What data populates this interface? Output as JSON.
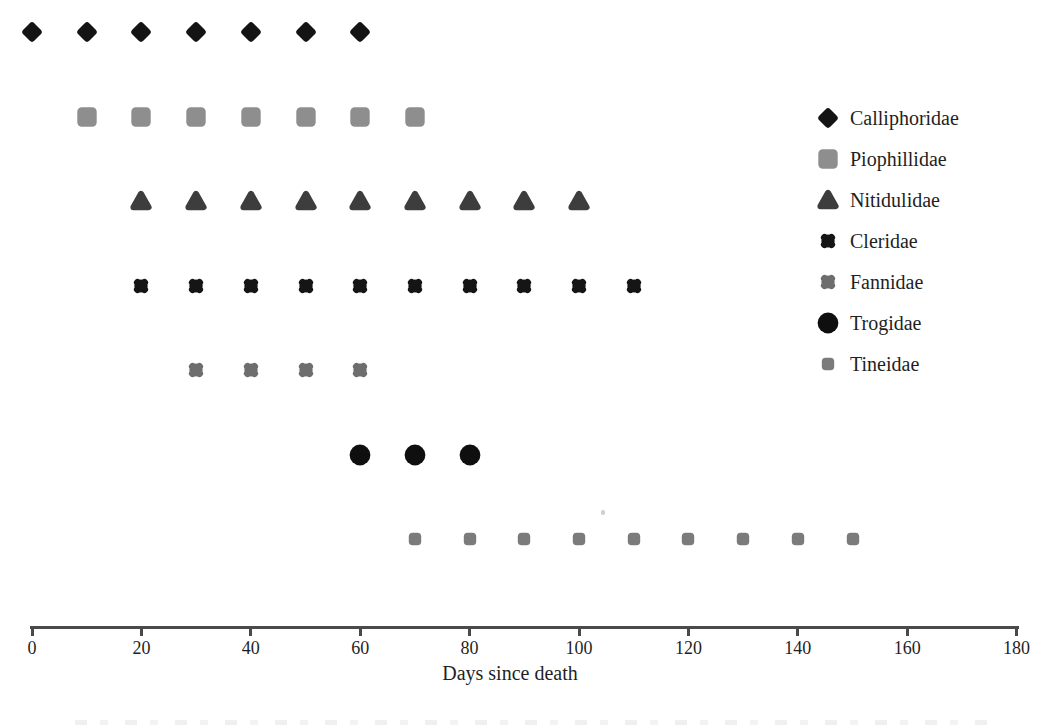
{
  "figure": {
    "background": "#ffffff",
    "text_color": "#1f1f1f",
    "axis_color": "#4a4a4a"
  },
  "chart_data": {
    "type": "scatter",
    "title": "",
    "subtitle": "",
    "xlabel": "Days since death",
    "ylabel": "",
    "grid": false,
    "legend_position": "right",
    "x_axis": {
      "min": 0,
      "max": 180,
      "tick_step": 20,
      "ticks": [
        {
          "value": 0,
          "label": "0"
        },
        {
          "value": 20,
          "label": "20"
        },
        {
          "value": 40,
          "label": "40"
        },
        {
          "value": 60,
          "label": "60"
        },
        {
          "value": 80,
          "label": "80"
        },
        {
          "value": 100,
          "label": "100"
        },
        {
          "value": 120,
          "label": "120"
        },
        {
          "value": 140,
          "label": "140"
        },
        {
          "value": 160,
          "label": "160"
        },
        {
          "value": 180,
          "label": "180"
        }
      ]
    },
    "series": [
      {
        "name": "Calliphoridae",
        "marker": "diamond",
        "color": "#141414",
        "days": [
          0,
          10,
          20,
          30,
          40,
          50,
          60
        ]
      },
      {
        "name": "Piophillidae",
        "marker": "square",
        "color": "#8e8e8e",
        "days": [
          10,
          20,
          30,
          40,
          50,
          60,
          70
        ]
      },
      {
        "name": "Nitidulidae",
        "marker": "triangle",
        "color": "#3d3d3d",
        "days": [
          20,
          30,
          40,
          50,
          60,
          70,
          80,
          90,
          100
        ]
      },
      {
        "name": "Cleridae",
        "marker": "xstar",
        "color": "#151515",
        "days": [
          20,
          30,
          40,
          50,
          60,
          70,
          80,
          90,
          100,
          110
        ]
      },
      {
        "name": "Fannidae",
        "marker": "xstar",
        "color": "#6e6e6e",
        "days": [
          30,
          40,
          50,
          60
        ]
      },
      {
        "name": "Trogidae",
        "marker": "circle",
        "color": "#0f0f0f",
        "days": [
          60,
          70,
          80
        ]
      },
      {
        "name": "Tineidae",
        "marker": "dot",
        "color": "#7b7b7b",
        "days": [
          70,
          80,
          90,
          100,
          110,
          120,
          130,
          140,
          150
        ]
      }
    ]
  }
}
